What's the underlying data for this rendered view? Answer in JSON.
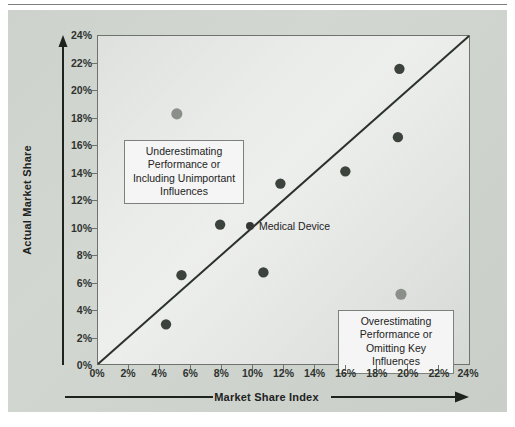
{
  "figure": {
    "background_color": "#cdd2cd",
    "panel_border_color": "#6e736e",
    "marker_color": "#3c423c",
    "marker_outlier_color": "#8a8f8a",
    "diagonal_color": "#2b312b",
    "callout_bg": "#f4f5f4"
  },
  "axes": {
    "x_title": "Market Share Index",
    "y_title": "Actual Market Share",
    "x_ticks": [
      "0%",
      "2%",
      "4%",
      "6%",
      "8%",
      "10%",
      "12%",
      "14%",
      "16%",
      "18%",
      "20%",
      "22%",
      "24%"
    ],
    "y_ticks": [
      "0%",
      "2%",
      "4%",
      "6%",
      "8%",
      "10%",
      "12%",
      "14%",
      "16%",
      "18%",
      "20%",
      "22%",
      "24%"
    ]
  },
  "annotations": {
    "underestimating": "Underestimating Performance or Including Unimportant Influences",
    "overestimating": "Overestimating Performance or Omitting Key Influences",
    "series_label": "Medical Device"
  },
  "chart_data": {
    "type": "scatter",
    "title": "",
    "subtitle": "",
    "xlabel": "Market Share Index",
    "ylabel": "Actual Market Share",
    "xlim": [
      0,
      24
    ],
    "ylim": [
      0,
      24
    ],
    "x_tick_values": [
      0,
      2,
      4,
      6,
      8,
      10,
      12,
      14,
      16,
      18,
      20,
      22,
      24
    ],
    "y_tick_values": [
      0,
      2,
      4,
      6,
      8,
      10,
      12,
      14,
      16,
      18,
      20,
      22,
      24
    ],
    "tick_format": "percent",
    "grid": false,
    "legend_position": "inside-center",
    "reference_line": {
      "name": "45-degree parity line",
      "from": [
        0,
        0
      ],
      "to": [
        24,
        24
      ]
    },
    "series": [
      {
        "name": "Medical Device",
        "marker": "circle",
        "color": "#3c423c",
        "points": [
          {
            "x": 4.4,
            "y": 2.9,
            "emphasis": "normal"
          },
          {
            "x": 5.4,
            "y": 6.5,
            "emphasis": "normal"
          },
          {
            "x": 5.1,
            "y": 18.3,
            "emphasis": "light"
          },
          {
            "x": 7.9,
            "y": 10.2,
            "emphasis": "normal"
          },
          {
            "x": 10.7,
            "y": 6.7,
            "emphasis": "normal"
          },
          {
            "x": 11.8,
            "y": 13.2,
            "emphasis": "normal"
          },
          {
            "x": 16.0,
            "y": 14.1,
            "emphasis": "normal"
          },
          {
            "x": 19.4,
            "y": 16.6,
            "emphasis": "normal"
          },
          {
            "x": 19.5,
            "y": 21.6,
            "emphasis": "normal"
          },
          {
            "x": 19.6,
            "y": 5.1,
            "emphasis": "light"
          }
        ]
      }
    ],
    "annotations": [
      {
        "id": "underestimating",
        "text": "Underestimating Performance or Including Unimportant Influences",
        "region": "above-parity-line"
      },
      {
        "id": "overestimating",
        "text": "Overestimating Performance or Omitting Key Influences",
        "region": "below-parity-line"
      }
    ]
  }
}
